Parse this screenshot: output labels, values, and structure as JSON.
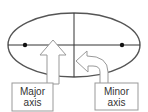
{
  "diagram": {
    "labels": {
      "major": [
        "Major",
        "axis"
      ],
      "minor": [
        "Minor",
        "axis"
      ]
    },
    "colors": {
      "ellipse": "#555555",
      "axes": "#333333",
      "foci": "#111111",
      "arrows": "#888888",
      "text": "#333333"
    }
  }
}
